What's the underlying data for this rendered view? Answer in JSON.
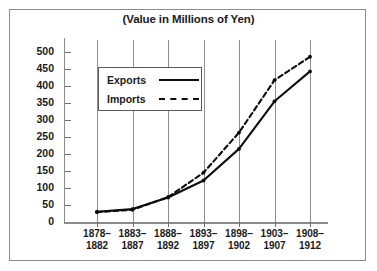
{
  "chart_data": {
    "type": "line",
    "title": "(Value in Millions of Yen)",
    "xlabel": "",
    "ylabel": "",
    "ylim": [
      0,
      500
    ],
    "yticks": [
      0,
      50,
      100,
      150,
      200,
      250,
      300,
      350,
      400,
      450,
      500
    ],
    "grid": "vertical",
    "legend_position": "upper-left-inside",
    "categories": [
      "1878–1882",
      "1883–1887",
      "1888–1892",
      "1893–1897",
      "1898–1902",
      "1903–1907",
      "1908–1912"
    ],
    "category_lines": [
      [
        "1878–",
        "1882"
      ],
      [
        "1883–",
        "1887"
      ],
      [
        "1888–",
        "1892"
      ],
      [
        "1893–",
        "1897"
      ],
      [
        "1898–",
        "1902"
      ],
      [
        "1903–",
        "1907"
      ],
      [
        "1908–",
        "1912"
      ]
    ],
    "series": [
      {
        "name": "Exports",
        "style": "solid",
        "color": "#0d0d0d",
        "values": [
          30,
          38,
          72,
          122,
          215,
          355,
          443
        ]
      },
      {
        "name": "Imports",
        "style": "dashed",
        "color": "#0d0d0d",
        "values": [
          29,
          36,
          73,
          145,
          263,
          417,
          486
        ]
      }
    ]
  },
  "legend": {
    "items": [
      {
        "label": "Exports",
        "style": "solid"
      },
      {
        "label": "Imports",
        "style": "dashed"
      }
    ]
  },
  "colors": {
    "ink": "#0d0d0d",
    "axis": "#8a8a8a",
    "grid": "#8f8f8f",
    "frame": "#8c8c8c",
    "background": "#ffffff"
  }
}
